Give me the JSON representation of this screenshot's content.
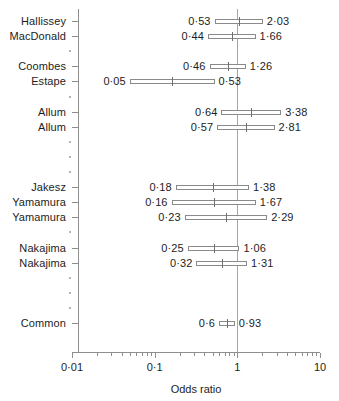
{
  "chart_data": {
    "type": "forest-plot",
    "title": "",
    "xlabel": "Odds ratio",
    "ylabel": "",
    "xscale": "log",
    "xlim": [
      0.01,
      10
    ],
    "xticks": [
      0.01,
      0.1,
      1,
      10
    ],
    "xtick_labels": [
      "0·01",
      "0·1",
      "1",
      "10"
    ],
    "reference_line": 1,
    "grid": false,
    "legend": null,
    "rows": [
      {
        "label": "Hallissey",
        "lower": 0.53,
        "upper": 2.03,
        "point": 1.04,
        "lower_label": "0·53",
        "upper_label": "2·03",
        "kind": "study"
      },
      {
        "label": "MacDonald",
        "lower": 0.44,
        "upper": 1.66,
        "point": 0.86,
        "lower_label": "0·44",
        "upper_label": "1·66",
        "kind": "study"
      },
      {
        "label": "",
        "lower": null,
        "upper": null,
        "point": null,
        "lower_label": "",
        "upper_label": "",
        "kind": "spacer"
      },
      {
        "label": "Coombes",
        "lower": 0.46,
        "upper": 1.26,
        "point": 0.76,
        "lower_label": "0·46",
        "upper_label": "1·26",
        "kind": "study"
      },
      {
        "label": "Estape",
        "lower": 0.05,
        "upper": 0.53,
        "point": 0.16,
        "lower_label": "0·05",
        "upper_label": "0·53",
        "kind": "study"
      },
      {
        "label": "",
        "lower": null,
        "upper": null,
        "point": null,
        "lower_label": "",
        "upper_label": "",
        "kind": "spacer"
      },
      {
        "label": "Allum",
        "lower": 0.64,
        "upper": 3.38,
        "point": 1.47,
        "lower_label": "0·64",
        "upper_label": "3·38",
        "kind": "study"
      },
      {
        "label": "Allum",
        "lower": 0.57,
        "upper": 2.81,
        "point": 1.27,
        "lower_label": "0·57",
        "upper_label": "2·81",
        "kind": "study"
      },
      {
        "label": "",
        "lower": null,
        "upper": null,
        "point": null,
        "lower_label": "",
        "upper_label": "",
        "kind": "spacer"
      },
      {
        "label": "",
        "lower": null,
        "upper": null,
        "point": null,
        "lower_label": "",
        "upper_label": "",
        "kind": "spacer"
      },
      {
        "label": "",
        "lower": null,
        "upper": null,
        "point": null,
        "lower_label": "",
        "upper_label": "",
        "kind": "spacer"
      },
      {
        "label": "Jakesz",
        "lower": 0.18,
        "upper": 1.38,
        "point": 0.5,
        "lower_label": "0·18",
        "upper_label": "1·38",
        "kind": "study"
      },
      {
        "label": "Yamamura",
        "lower": 0.16,
        "upper": 1.67,
        "point": 0.52,
        "lower_label": "0·16",
        "upper_label": "1·67",
        "kind": "study"
      },
      {
        "label": "Yamamura",
        "lower": 0.23,
        "upper": 2.29,
        "point": 0.72,
        "lower_label": "0·23",
        "upper_label": "2·29",
        "kind": "study"
      },
      {
        "label": "",
        "lower": null,
        "upper": null,
        "point": null,
        "lower_label": "",
        "upper_label": "",
        "kind": "spacer"
      },
      {
        "label": "Nakajima",
        "lower": 0.25,
        "upper": 1.06,
        "point": 0.52,
        "lower_label": "0·25",
        "upper_label": "1·06",
        "kind": "study"
      },
      {
        "label": "Nakajima",
        "lower": 0.32,
        "upper": 1.31,
        "point": 0.65,
        "lower_label": "0·32",
        "upper_label": "1·31",
        "kind": "study"
      },
      {
        "label": "",
        "lower": null,
        "upper": null,
        "point": null,
        "lower_label": "",
        "upper_label": "",
        "kind": "spacer"
      },
      {
        "label": "",
        "lower": null,
        "upper": null,
        "point": null,
        "lower_label": "",
        "upper_label": "",
        "kind": "spacer"
      },
      {
        "label": "",
        "lower": null,
        "upper": null,
        "point": null,
        "lower_label": "",
        "upper_label": "",
        "kind": "spacer"
      },
      {
        "label": "Common",
        "lower": 0.6,
        "upper": 0.93,
        "point": 0.75,
        "lower_label": "0·6",
        "upper_label": "0·93",
        "kind": "summary"
      }
    ]
  },
  "colors": {
    "axis": "#8e8e8e",
    "reference": "#a5a5a5",
    "marker": "#6f6f6f",
    "box_border": "#8a8a8a",
    "text": "#1d1d1d",
    "background": "#ffffff"
  }
}
